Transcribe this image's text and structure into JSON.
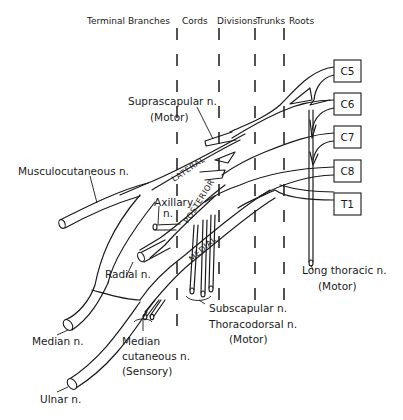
{
  "figure": {
    "type": "anatomical-diagram",
    "column_headers": [
      "Terminal Branches",
      "Cords",
      "Divisions",
      "Trunks",
      "Roots"
    ],
    "roots": [
      "C5",
      "C6",
      "C7",
      "C8",
      "T1"
    ],
    "cords": [
      "LATERAL",
      "POSTERIOR",
      "MEDIAL"
    ],
    "labels": {
      "suprascapular": "Suprascapular n.",
      "suprascapular_type": "(Motor)",
      "musculocutaneous": "Musculocutaneous n.",
      "axillary_1": "Axillary",
      "axillary_2": "n.",
      "radial": "Radial n.",
      "median": "Median n.",
      "ulnar": "Ulnar n.",
      "median_cutaneous_1": "Median",
      "median_cutaneous_2": "cutaneous n.",
      "median_cutaneous_type": "(Sensory)",
      "subscapular": "Subscapular n.",
      "thoracodorsal": "Thoracodorsal n.",
      "thoracodorsal_type": "(Motor)",
      "long_thoracic": "Long thoracic n.",
      "long_thoracic_type": "(Motor)"
    }
  }
}
